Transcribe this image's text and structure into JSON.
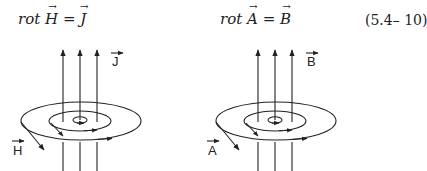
{
  "equations": [
    {
      "lhs_operator": "rot",
      "lhs_vector": "H",
      "equals": "=",
      "rhs_vector": "J"
    },
    {
      "lhs_operator": "rot",
      "lhs_vector": "A",
      "equals": "=",
      "rhs_vector": "B"
    }
  ],
  "equation_number": "(5.4– 10)",
  "diagrams": [
    {
      "name": "left",
      "current_label": "J",
      "field_label": "H"
    },
    {
      "name": "right",
      "current_label": "B",
      "field_label": "A"
    }
  ],
  "colors": {
    "ink": "#222222",
    "background": "#ffffff"
  }
}
